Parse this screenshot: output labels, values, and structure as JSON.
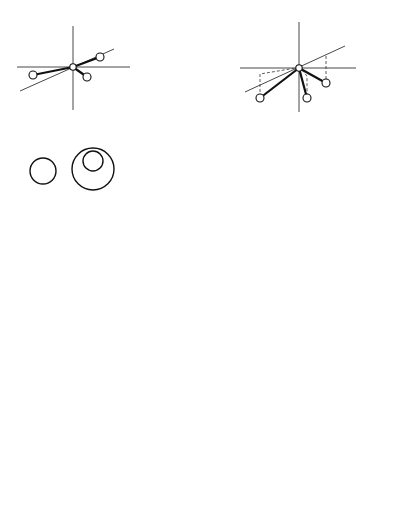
{
  "diagram": {
    "columns": [
      {
        "id": "planar",
        "title": "Planar (BH",
        "title_sub": "3",
        "title_close": ")",
        "axes": {
          "x": "x",
          "y": "y",
          "z": "z"
        }
      },
      {
        "id": "pyramidal",
        "title": "Pyramidal (NH",
        "title_sub": "3",
        "title_close": ")",
        "axes": {
          "x": "x",
          "y": "y",
          "z": "z"
        }
      }
    ],
    "orbitals": {
      "s": {
        "label": "s"
      },
      "py": {
        "label": "p",
        "sub": "y"
      },
      "px": {
        "label": "p",
        "sub": "x",
        "note_line1": "No overlap of",
        "note_line2_prefix": "third H 1",
        "note_line2_italic": "s"
      },
      "pz": {
        "label": "p",
        "sub": "z",
        "planar_note_line1_prefix": "All H 1",
        "planar_note_line1_italic": "s",
        "planar_note_line1_suffix": " in",
        "planar_note_line2_label": "p",
        "planar_note_line2_sub": "z",
        "planar_note_line2_suffix": " nodal plane"
      }
    },
    "signs": {
      "plus": "+",
      "minus": "−",
      "plus_minus": "±",
      "minus_plus": "∓"
    }
  }
}
